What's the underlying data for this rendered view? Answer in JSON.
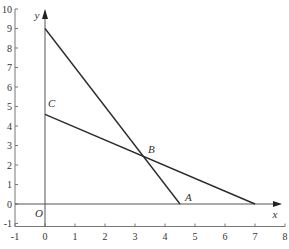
{
  "chart_data": {
    "type": "line",
    "title": "",
    "xlabel": "x",
    "ylabel": "y",
    "xlim": [
      -1,
      8
    ],
    "ylim": [
      -1,
      10
    ],
    "x_ticks": [
      -1,
      0,
      1,
      2,
      3,
      4,
      5,
      6,
      7,
      8
    ],
    "y_ticks": [
      -1,
      0,
      1,
      2,
      3,
      4,
      5,
      6,
      7,
      8,
      9,
      10
    ],
    "grid": false,
    "series": [
      {
        "name": "line-1",
        "points": [
          [
            0,
            9
          ],
          [
            4.5,
            0
          ]
        ]
      },
      {
        "name": "line-2",
        "points": [
          [
            0,
            4.6
          ],
          [
            7,
            0
          ]
        ]
      }
    ],
    "annotations": [
      {
        "label": "O",
        "x": 0,
        "y": 0
      },
      {
        "label": "A",
        "x": 4.5,
        "y": 0
      },
      {
        "label": "B",
        "x": 3.3,
        "y": 2.4
      },
      {
        "label": "C",
        "x": 0,
        "y": 4.6
      }
    ],
    "colors": {
      "line": "#2a2a2a",
      "axis": "#555555",
      "frame": "#777777"
    }
  }
}
